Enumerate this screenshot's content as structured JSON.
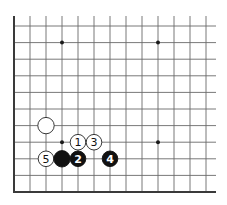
{
  "diagram": {
    "type": "go-board-fragment",
    "corner": "lower-left",
    "columns_visible": 13,
    "rows_visible": 11,
    "colors": {
      "background": "#ffffff",
      "grid": "#6a6a6a",
      "edge": "#3a3a3a",
      "black_stone": "#111111",
      "white_stone": "#ffffff"
    },
    "star_points": [
      {
        "col": 3,
        "row": 1
      },
      {
        "col": 9,
        "row": 1
      },
      {
        "col": 3,
        "row": 7
      },
      {
        "col": 9,
        "row": 7
      }
    ],
    "stones": [
      {
        "color": "white",
        "col": 2,
        "row": 6,
        "label": ""
      },
      {
        "color": "white",
        "col": 4,
        "row": 7,
        "label": "1"
      },
      {
        "color": "black",
        "col": 4,
        "row": 8,
        "label": "2"
      },
      {
        "color": "white",
        "col": 5,
        "row": 7,
        "label": "3"
      },
      {
        "color": "black",
        "col": 6,
        "row": 8,
        "label": "4"
      },
      {
        "color": "white",
        "col": 2,
        "row": 8,
        "label": "5"
      },
      {
        "color": "black",
        "col": 3,
        "row": 8,
        "label": ""
      }
    ]
  }
}
